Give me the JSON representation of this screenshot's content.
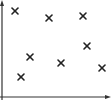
{
  "chart_data": {
    "type": "scatter",
    "title": "",
    "xlabel": "",
    "ylabel": "",
    "marker": "x",
    "grid": false,
    "legend": null,
    "xlim": [
      0,
      108
    ],
    "ylim": [
      0,
      97
    ],
    "axis_arrows": true,
    "colors": {
      "axis": "#333333",
      "marker": "#222222",
      "background": "#ffffff"
    },
    "series": [
      {
        "name": "points",
        "points": [
          {
            "x": 13,
            "y": 86
          },
          {
            "x": 47,
            "y": 79
          },
          {
            "x": 81,
            "y": 81
          },
          {
            "x": 85,
            "y": 51
          },
          {
            "x": 28,
            "y": 40
          },
          {
            "x": 59,
            "y": 34
          },
          {
            "x": 100,
            "y": 29
          },
          {
            "x": 19,
            "y": 20
          }
        ]
      }
    ]
  }
}
